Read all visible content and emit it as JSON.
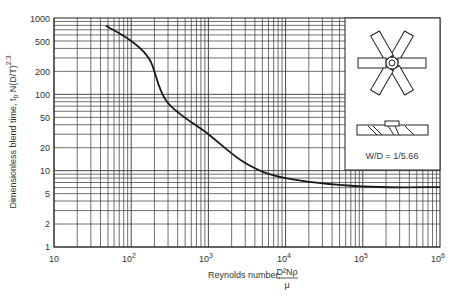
{
  "chart_data": {
    "type": "line",
    "title": "",
    "xlabel": "Reynolds number, D²Nρ/μ",
    "ylabel": "Dimensionless blend time, t_b N(D/T)^2.3",
    "x_scale": "log",
    "y_scale": "log",
    "xlim": [
      10,
      1000000
    ],
    "ylim": [
      1,
      1000
    ],
    "grid": true,
    "x_ticks": [
      "10",
      "10²",
      "10³",
      "10⁴",
      "10⁵",
      "10⁶"
    ],
    "y_ticks": [
      "1",
      "2",
      "5",
      "10",
      "20",
      "50",
      "100",
      "200",
      "500",
      "1000"
    ],
    "series": [
      {
        "name": "Blend time curve",
        "x": [
          47,
          100,
          175,
          290,
          1000,
          3000,
          10000,
          100000,
          1000000
        ],
        "y": [
          790,
          500,
          280,
          80,
          30,
          12.6,
          8,
          6.2,
          6.1
        ]
      }
    ],
    "annotations": [
      {
        "text": "W/D = 1/5.66",
        "position": "inset, right"
      }
    ],
    "inset": {
      "description": "Impeller diagram: 6-blade pitched-blade turbine (top view and side view)",
      "label": "W/D = 1/5.66"
    }
  },
  "labels": {
    "x_title_prefix": "Reynolds number,",
    "x_title_num": "D²Nρ",
    "x_title_den": "μ",
    "y_title": "Dimensionless blend time, t",
    "y_title_sub": "b",
    "y_title_rest": " N(D/T)",
    "y_title_sup": "2.3",
    "inset_label": "W/D = 1/5.66",
    "y_tick_1": "1",
    "y_tick_2": "2",
    "y_tick_5": "5",
    "y_tick_10": "10",
    "y_tick_20": "20",
    "y_tick_50": "50",
    "y_tick_100": "100",
    "y_tick_200": "200",
    "y_tick_500": "500",
    "y_tick_1000": "1000",
    "x_tick_10": "10",
    "x_tick_base": "10",
    "x_exp_2": "2",
    "x_exp_3": "3",
    "x_exp_4": "4",
    "x_exp_5": "5",
    "x_exp_6": "6"
  },
  "colors": {
    "line": "#1a1a1a",
    "grid": "#333333",
    "background": "#ffffff"
  }
}
